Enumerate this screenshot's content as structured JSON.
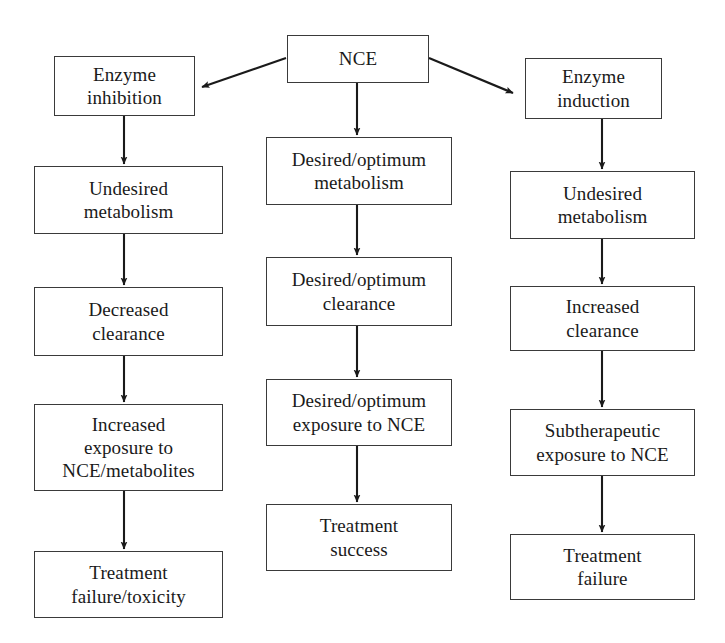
{
  "diagram": {
    "colors": {
      "background": "#ffffff",
      "box_border": "#3a3a3a",
      "text": "#1a1a1a",
      "arrow": "#1a1a1a"
    },
    "columns": {
      "left": {
        "name": "Enzyme inhibition pathway",
        "nodes": [
          {
            "id": "enzyme-inhibition",
            "label": "Enzyme\ninhibition"
          },
          {
            "id": "undesired-metabolism-left",
            "label": "Undesired\nmetabolism"
          },
          {
            "id": "decreased-clearance",
            "label": "Decreased\nclearance"
          },
          {
            "id": "increased-exposure",
            "label": "Increased\nexposure to\nNCE/metabolites"
          },
          {
            "id": "treatment-failure-toxicity",
            "label": "Treatment\nfailure/toxicity"
          }
        ]
      },
      "middle": {
        "name": "Desired metabolism pathway",
        "nodes": [
          {
            "id": "nce",
            "label": "NCE"
          },
          {
            "id": "desired-metabolism",
            "label": "Desired/optimum\nmetabolism"
          },
          {
            "id": "desired-clearance",
            "label": "Desired/optimum\nclearance"
          },
          {
            "id": "desired-exposure",
            "label": "Desired/optimum\nexposure to NCE"
          },
          {
            "id": "treatment-success",
            "label": "Treatment\nsuccess"
          }
        ]
      },
      "right": {
        "name": "Enzyme induction pathway",
        "nodes": [
          {
            "id": "enzyme-induction",
            "label": "Enzyme\ninduction"
          },
          {
            "id": "undesired-metabolism-right",
            "label": "Undesired\nmetabolism"
          },
          {
            "id": "increased-clearance",
            "label": "Increased\nclearance"
          },
          {
            "id": "subtherapeutic-exposure",
            "label": "Subtherapeutic\nexposure to NCE"
          },
          {
            "id": "treatment-failure",
            "label": "Treatment\nfailure"
          }
        ]
      }
    },
    "edges": [
      {
        "id": "nce-to-enzyme-inhibition",
        "from": "nce",
        "to": "enzyme-inhibition",
        "type": "diagonal-arrow"
      },
      {
        "id": "nce-to-desired-metabolism",
        "from": "nce",
        "to": "desired-metabolism",
        "type": "vertical-arrow"
      },
      {
        "id": "nce-to-enzyme-induction",
        "from": "nce",
        "to": "enzyme-induction",
        "type": "diagonal-arrow"
      },
      {
        "id": "enzyme-inhibition-to-undesired-metabolism",
        "from": "enzyme-inhibition",
        "to": "undesired-metabolism-left",
        "type": "vertical-arrow"
      },
      {
        "id": "undesired-metabolism-to-decreased-clearance",
        "from": "undesired-metabolism-left",
        "to": "decreased-clearance",
        "type": "vertical-arrow"
      },
      {
        "id": "decreased-clearance-to-increased-exposure",
        "from": "decreased-clearance",
        "to": "increased-exposure",
        "type": "vertical-arrow"
      },
      {
        "id": "increased-exposure-to-treatment-failure-toxicity",
        "from": "increased-exposure",
        "to": "treatment-failure-toxicity",
        "type": "vertical-arrow"
      },
      {
        "id": "desired-metabolism-to-desired-clearance",
        "from": "desired-metabolism",
        "to": "desired-clearance",
        "type": "vertical-arrow"
      },
      {
        "id": "desired-clearance-to-desired-exposure",
        "from": "desired-clearance",
        "to": "desired-exposure",
        "type": "vertical-arrow"
      },
      {
        "id": "desired-exposure-to-treatment-success",
        "from": "desired-exposure",
        "to": "treatment-success",
        "type": "vertical-arrow"
      },
      {
        "id": "enzyme-induction-to-undesired-metabolism",
        "from": "enzyme-induction",
        "to": "undesired-metabolism-right",
        "type": "vertical-arrow"
      },
      {
        "id": "undesired-metabolism-to-increased-clearance",
        "from": "undesired-metabolism-right",
        "to": "increased-clearance",
        "type": "vertical-arrow"
      },
      {
        "id": "increased-clearance-to-subtherapeutic-exposure",
        "from": "increased-clearance",
        "to": "subtherapeutic-exposure",
        "type": "vertical-arrow"
      },
      {
        "id": "subtherapeutic-exposure-to-treatment-failure",
        "from": "subtherapeutic-exposure",
        "to": "treatment-failure",
        "type": "vertical-arrow"
      }
    ]
  }
}
